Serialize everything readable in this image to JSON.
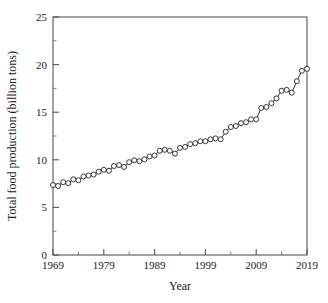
{
  "chart_data": {
    "type": "line",
    "title": "",
    "xlabel": "Year",
    "ylabel": "Total food production (billion tons)",
    "xlim": [
      1969,
      2019
    ],
    "ylim": [
      0,
      25
    ],
    "grid": false,
    "legend": null,
    "marker": "open-circle",
    "x_ticks_major": [
      1969,
      1979,
      1989,
      1999,
      2009,
      2019
    ],
    "x_ticks_minor": [
      1974,
      1984,
      1994,
      2004,
      2014
    ],
    "y_ticks_major": [
      0,
      5,
      10,
      15,
      20,
      25
    ],
    "y_ticks_minor": [
      2.5,
      7.5,
      12.5,
      17.5,
      22.5
    ],
    "x_tick_labels": [
      "1969",
      "1979",
      "1989",
      "1999",
      "2009",
      "2019"
    ],
    "y_tick_labels": [
      "0",
      "5",
      "10",
      "15",
      "20",
      "25"
    ],
    "series": [
      {
        "name": "Total food production",
        "x": [
          1969,
          1970,
          1971,
          1972,
          1973,
          1974,
          1975,
          1976,
          1977,
          1978,
          1979,
          1980,
          1981,
          1982,
          1983,
          1984,
          1985,
          1986,
          1987,
          1988,
          1989,
          1990,
          1991,
          1992,
          1993,
          1994,
          1995,
          1996,
          1997,
          1998,
          1999,
          2000,
          2001,
          2002,
          2003,
          2004,
          2005,
          2006,
          2007,
          2008,
          2009,
          2010,
          2011,
          2012,
          2013,
          2014,
          2015,
          2016,
          2017,
          2018,
          2019
        ],
        "values": [
          7.35,
          7.25,
          7.65,
          7.55,
          7.95,
          7.85,
          8.25,
          8.35,
          8.45,
          8.75,
          8.95,
          8.85,
          9.35,
          9.45,
          9.25,
          9.75,
          9.95,
          9.85,
          10.05,
          10.35,
          10.45,
          10.95,
          11.05,
          10.95,
          10.65,
          11.25,
          11.35,
          11.65,
          11.75,
          11.95,
          11.95,
          12.15,
          12.25,
          12.15,
          12.95,
          13.45,
          13.55,
          13.85,
          13.95,
          14.25,
          14.25,
          15.45,
          15.55,
          15.95,
          16.45,
          17.25,
          17.35,
          17.05,
          18.25,
          19.35,
          19.55
        ]
      }
    ],
    "value_range": {
      "min": 7.25,
      "max": 20.7
    },
    "end_point": {
      "x": 2019,
      "y": 20.7
    }
  },
  "axes": {
    "x_axis_name": "Year",
    "y_axis_name": "Total food production (billion tons)"
  }
}
